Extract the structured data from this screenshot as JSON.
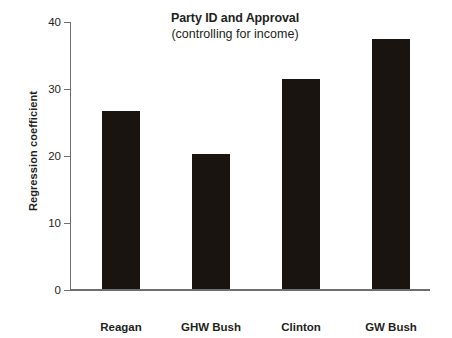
{
  "chart_data": {
    "type": "bar",
    "title": "Party ID and Approval",
    "subtitle": "(controlling for income)",
    "xlabel": "",
    "ylabel": "Regression coefficient",
    "categories": [
      "Reagan",
      "GHW Bush",
      "Clinton",
      "GW Bush"
    ],
    "values": [
      26.6,
      20.1,
      31.3,
      37.3
    ],
    "ylim": [
      0,
      40
    ],
    "yticks": [
      0,
      10,
      20,
      30,
      40
    ],
    "ytick_labels": [
      "0",
      "10",
      "20",
      "30",
      "40"
    ],
    "grid": false,
    "legend": null,
    "bar_color": "#1a1411",
    "axis_color": "#6d6e71",
    "text_color": "#231f20",
    "background": "#ffffff"
  }
}
